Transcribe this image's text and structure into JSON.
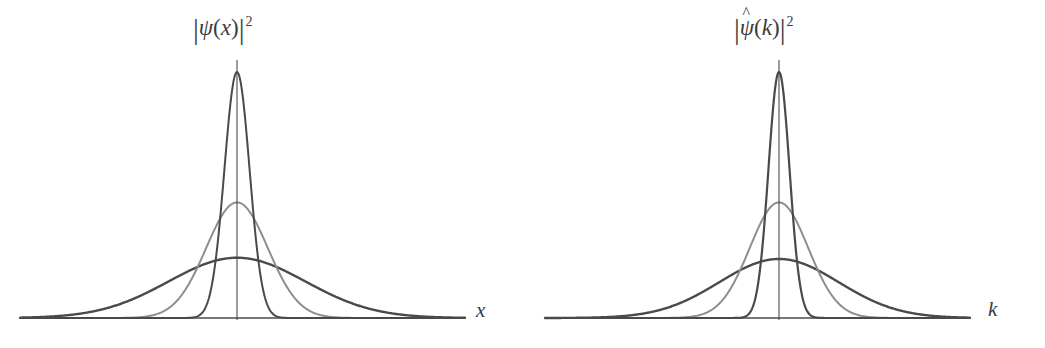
{
  "figure": {
    "name": "gaussian-wave-packet-fourier-pair",
    "background": "#ffffff",
    "panel_count": 2
  },
  "style": {
    "axis_color": "#4a4a4a",
    "curve_dark": "#4a4a4a",
    "curve_mid": "#8e8e8e",
    "curve_light": "#9a9a9a",
    "label_color": "#3b3b3b"
  },
  "panels": {
    "position": {
      "id": "panel-position",
      "ylabel": {
        "full": "|ψ(x)|²",
        "bar": "|",
        "psi": "ψ",
        "open_paren": "(",
        "variable": "x",
        "close_paren": ")",
        "exponent": "2",
        "hat": ""
      },
      "xlabel": "x",
      "axis": {
        "baseline_y": 318,
        "origin_x": 237,
        "x_start": 22,
        "x_end": 465,
        "vertical_top": 60
      }
    },
    "momentum": {
      "id": "panel-momentum",
      "ylabel": {
        "full": "|ψ̂(k)|²",
        "bar": "|",
        "psi": "ψ",
        "open_paren": "(",
        "variable": "k",
        "close_paren": ")",
        "exponent": "2",
        "hat": "^"
      },
      "xlabel": "k",
      "axis": {
        "baseline_y": 318,
        "origin_x": 257,
        "x_start": 23,
        "x_end": 446,
        "vertical_top": 60
      }
    }
  },
  "chart_data": [
    {
      "type": "line",
      "title": "|ψ(x)|²",
      "xlabel": "x",
      "ylabel": "|ψ(x)|²",
      "grid": false,
      "legend": "none",
      "axis_visible": {
        "x": true,
        "y": true
      },
      "xlim": [
        -1.0,
        1.0
      ],
      "ylim": [
        0.0,
        1.05
      ],
      "note": "Position-space probability densities: three Gaussians of differing width, normalized so narrower means taller.",
      "series": [
        {
          "name": "narrow-packet",
          "color": "#4a4a4a",
          "linewidth": 2.0,
          "shape": "gaussian",
          "center": 0.0,
          "sigma": 0.055,
          "peak": 1.0,
          "peak_pixel_y": 72
        },
        {
          "name": "medium-packet",
          "color": "#8e8e8e",
          "linewidth": 2.0,
          "shape": "gaussian",
          "center": 0.0,
          "sigma": 0.135,
          "peak": 0.47,
          "peak_pixel_y": 197
        },
        {
          "name": "wide-packet",
          "color": "#4a4a4a",
          "linewidth": 2.4,
          "shape": "gaussian",
          "center": 0.0,
          "sigma": 0.3,
          "peak": 0.245,
          "peak_pixel_y": 257
        }
      ]
    },
    {
      "type": "line",
      "title": "|ψ̂(k)|²",
      "xlabel": "k",
      "ylabel": "|ψ̂(k)|²",
      "grid": false,
      "legend": "none",
      "axis_visible": {
        "x": true,
        "y": true
      },
      "xlim": [
        -1.0,
        1.0
      ],
      "ylim": [
        0.0,
        1.05
      ],
      "note": "Momentum-space densities: Fourier transforms of the left panel, widths inverted (narrow x gives wide k and vice versa).",
      "series": [
        {
          "name": "narrow-packet-transform",
          "color": "#4a4a4a",
          "linewidth": 2.2,
          "shape": "gaussian",
          "center": 0.0,
          "sigma": 0.045,
          "peak": 1.0,
          "peak_pixel_y": 73
        },
        {
          "name": "medium-packet-transform",
          "color": "#8e8e8e",
          "linewidth": 2.0,
          "shape": "gaussian",
          "center": 0.0,
          "sigma": 0.125,
          "peak": 0.47,
          "peak_pixel_y": 197
        },
        {
          "name": "wide-packet-transform",
          "color": "#4a4a4a",
          "linewidth": 2.4,
          "shape": "gaussian",
          "center": 0.0,
          "sigma": 0.255,
          "peak": 0.24,
          "peak_pixel_y": 258
        }
      ]
    }
  ]
}
